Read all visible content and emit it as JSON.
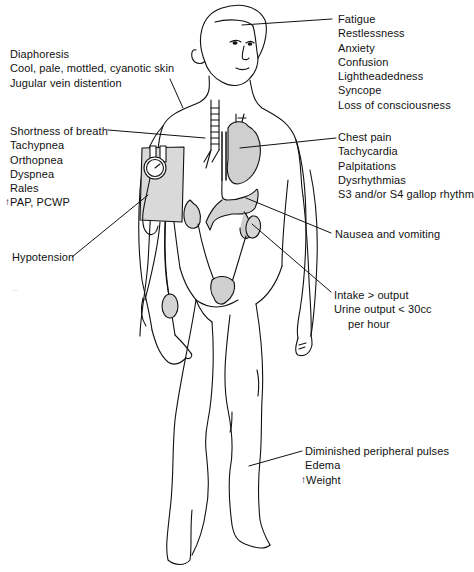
{
  "figure": {
    "type": "anatomical-symptom-diagram"
  },
  "labels": {
    "neuro": {
      "items": [
        "Fatigue",
        "Restlessness",
        "Anxiety",
        "Confusion",
        "Lightheadedness",
        "Syncope",
        "Loss of consciousness"
      ],
      "target": "head"
    },
    "skin": {
      "items": [
        "Diaphoresis",
        "Cool, pale, mottled, cyanotic skin",
        "Jugular vein distention"
      ],
      "target": "neck"
    },
    "respiratory": {
      "items": [
        "Shortness of breath",
        "Tachypnea",
        "Orthopnea",
        "Dyspnea",
        "Rales"
      ],
      "arrow_item": {
        "arrow": "↑",
        "text": "PAP, PCWP"
      },
      "target": "lungs"
    },
    "cardiac": {
      "items": [
        "Chest pain",
        "Tachycardia",
        "Palpitations",
        "Dysrhythmias",
        "S3 and/or S4 gallop rhythm"
      ],
      "target": "heart"
    },
    "blood_pressure": {
      "items": [
        "Hypotension"
      ],
      "target": "blood-pressure-cuff"
    },
    "gi": {
      "items": [
        "Nausea and vomiting"
      ],
      "target": "stomach"
    },
    "renal": {
      "items": [
        "Intake > output",
        "Urine output < 30cc"
      ],
      "continuation": "per hour",
      "target": "kidney"
    },
    "peripheral": {
      "items": [
        "Diminished peripheral pulses",
        "Edema"
      ],
      "arrow_item": {
        "arrow": "↑",
        "text": "Weight"
      },
      "target": "lower-leg"
    }
  },
  "stray_mark": "..."
}
